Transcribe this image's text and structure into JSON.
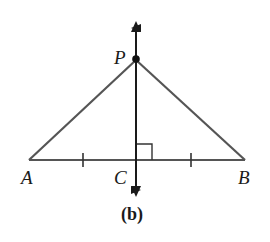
{
  "diagram": {
    "caption": "(b)",
    "points": {
      "A": {
        "label": "A"
      },
      "B": {
        "label": "B"
      },
      "C": {
        "label": "C"
      },
      "P": {
        "label": "P"
      }
    },
    "segments": [
      "PA",
      "PB",
      "AB"
    ],
    "perpendicular_line": "through C and P (perpendicular bisector of AB)",
    "marks": [
      "tick on AC",
      "tick on CB",
      "right angle at C"
    ],
    "colors": {
      "triangle_sides": "#555555",
      "perpendicular": "#1a1a1a"
    }
  }
}
